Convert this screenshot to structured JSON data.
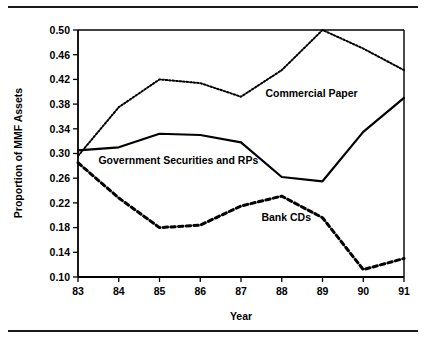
{
  "figure": {
    "rules": {
      "top": "horizontal-rule",
      "bottom": "horizontal-rule"
    }
  },
  "chart_data": {
    "type": "line",
    "title": "",
    "xlabel": "Year",
    "ylabel": "Proportion of MMF Assets",
    "x": [
      83,
      84,
      85,
      86,
      87,
      88,
      89,
      90,
      91
    ],
    "xtick_labels": [
      "83",
      "84",
      "85",
      "86",
      "87",
      "88",
      "89",
      "90",
      "91"
    ],
    "xlim": [
      83,
      91
    ],
    "ylim": [
      0.1,
      0.5
    ],
    "ytick_labels": [
      "0.50",
      "0.46",
      "0.42",
      "0.38",
      "0.34",
      "0.30",
      "0.26",
      "0.22",
      "0.18",
      "0.14",
      "0.10"
    ],
    "yticks": [
      0.5,
      0.46,
      0.42,
      0.38,
      0.34,
      0.3,
      0.26,
      0.22,
      0.18,
      0.14,
      0.1
    ],
    "grid": false,
    "legend": "inline-annotations",
    "series": [
      {
        "name": "Commercial Paper",
        "style": "dotted",
        "values": [
          0.296,
          0.375,
          0.42,
          0.414,
          0.392,
          0.435,
          0.5,
          0.47,
          0.435
        ],
        "annotation": {
          "text": "Commercial Paper",
          "x": 87.6,
          "y": 0.392
        }
      },
      {
        "name": "Government Securities and RPs",
        "style": "solid",
        "values": [
          0.305,
          0.31,
          0.332,
          0.33,
          0.318,
          0.262,
          0.255,
          0.335,
          0.39
        ],
        "annotation": {
          "text": "Government Securities and RPs",
          "x": 83.5,
          "y": 0.283
        }
      },
      {
        "name": "Bank CDs",
        "style": "dashed",
        "values": [
          0.285,
          0.228,
          0.18,
          0.184,
          0.215,
          0.231,
          0.196,
          0.112,
          0.13
        ],
        "annotation": {
          "text": "Bank CDs",
          "x": 87.5,
          "y": 0.19
        }
      }
    ]
  }
}
